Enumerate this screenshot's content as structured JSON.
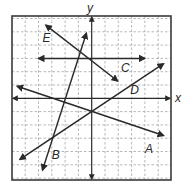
{
  "chart_data": {
    "type": "line",
    "title": "",
    "xlabel": "x",
    "ylabel": "y",
    "xlim": [
      -6,
      6
    ],
    "ylim": [
      -6,
      6
    ],
    "grid": true,
    "grid_step": 1,
    "series": [
      {
        "name": "A",
        "points": [
          [
            -5.6,
            0.9
          ],
          [
            5.4,
            -2.8
          ]
        ],
        "label_pos": [
          4.3,
          -3.8
        ]
      },
      {
        "name": "B",
        "points": [
          [
            -0.4,
            4.9
          ],
          [
            -3.7,
            -5.4
          ]
        ],
        "label_pos": [
          -2.7,
          -4.3
        ]
      },
      {
        "name": "C",
        "points": [
          [
            -4,
            3
          ],
          [
            4,
            3
          ]
        ],
        "label_pos": [
          2.5,
          2.3
        ]
      },
      {
        "name": "D",
        "points": [
          [
            5.4,
            2.6
          ],
          [
            -5.4,
            -4.6
          ]
        ],
        "label_pos": [
          3.2,
          0.6
        ]
      },
      {
        "name": "E",
        "points": [
          [
            -3.45,
            5.5
          ],
          [
            1.95,
            1.3
          ]
        ],
        "label_pos": [
          -3.4,
          4.5
        ]
      }
    ]
  },
  "labels": {
    "x_axis": "x",
    "y_axis": "y",
    "A": "A",
    "B": "B",
    "C": "C",
    "D": "D",
    "E": "E"
  },
  "colors": {
    "line": "#2a2a2a",
    "grid": "#9a9a9a",
    "frame": "#3a3a3a",
    "background": "#ffffff"
  }
}
